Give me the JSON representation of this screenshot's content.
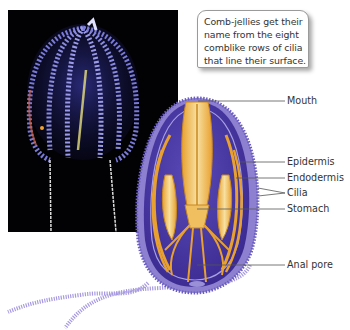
{
  "caption": {
    "lines": [
      "Comb-jellies get their",
      "name from the eight",
      "comblike rows of cilia",
      "that line their surface."
    ]
  },
  "labels": {
    "mouth": "Mouth",
    "epidermis": "Epidermis",
    "endodermis": "Endodermis",
    "cilia": "Cilia",
    "stomach": "Stomach",
    "anal_pore": "Anal pore"
  },
  "colors": {
    "photo_background": "#020205",
    "body_purple": "#4b3aa0",
    "body_rim": "#8d80d0",
    "organ_orange": "#e8a030",
    "organ_cream": "#f5d890",
    "leader_line": "#555555"
  }
}
